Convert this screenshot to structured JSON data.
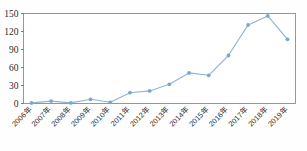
{
  "chart_data": {
    "type": "line",
    "title": "",
    "subtitle": "",
    "xlabel": "",
    "ylabel": "",
    "categories": [
      "2006年",
      "2007年",
      "2008年",
      "2009年",
      "2010年",
      "2011年",
      "2012年",
      "2013年",
      "2014年",
      "2015年",
      "2016年",
      "2017年",
      "2018年",
      "2019年"
    ],
    "values": [
      1,
      4,
      1,
      7,
      2,
      18,
      21,
      32,
      51,
      47,
      80,
      131,
      146,
      107
    ],
    "series": [
      {
        "name": "",
        "values": [
          1,
          4,
          1,
          7,
          2,
          18,
          21,
          32,
          51,
          47,
          80,
          131,
          146,
          107
        ]
      }
    ],
    "ylim": [
      0,
      150
    ],
    "yticks": [
      0,
      30,
      60,
      90,
      120,
      150
    ],
    "ytick_labels": [
      "0",
      "30",
      "60",
      "90",
      "120",
      "150"
    ],
    "xtick_labels": [
      "2006年",
      "2007年",
      "2008年",
      "2009年",
      "2010年",
      "2011年",
      "2012年",
      "2013年",
      "2014年",
      "2015年",
      "2016年",
      "2017年",
      "2018年",
      "2019年"
    ],
    "grid": false,
    "legend": false,
    "legend_position": "none",
    "marker": "circle",
    "line_color": "#8fb4d4",
    "marker_color": "#7ba7cc",
    "axis_color": "#6f6f6f",
    "frame_color": "#8d8d8d",
    "background_color": "#ffffff",
    "xtick_rotation": -45
  }
}
